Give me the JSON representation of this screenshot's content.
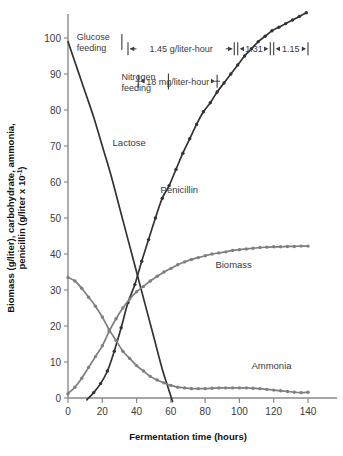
{
  "chart_data": {
    "type": "line",
    "title": "",
    "xlabel": "Fermentation time (hours)",
    "ylabel": "Biomass (g/liter), carbohydrate, ammonia, penicillin (g/liter x 10",
    "ylabel_sup": "-1",
    "ylabel_tail": ")",
    "xlim": [
      0,
      140
    ],
    "ylim": [
      0,
      105
    ],
    "xticks": [
      0,
      20,
      40,
      60,
      80,
      100,
      120,
      140
    ],
    "xtick_labels": [
      "0",
      "20",
      "40",
      "60",
      "80",
      "100",
      "120",
      "140"
    ],
    "yticks": [
      0,
      10,
      20,
      30,
      40,
      50,
      60,
      70,
      80,
      90,
      100
    ],
    "ytick_labels": [
      "0",
      "10",
      "20",
      "30",
      "40",
      "50",
      "60",
      "70",
      "80",
      "90",
      "100"
    ],
    "grid": false,
    "legend": "inline-labels",
    "series": [
      {
        "name": "Lactose",
        "color": "#333333",
        "label_x": 26,
        "label_y": 70,
        "markers": false,
        "x": [
          0,
          5,
          10,
          15,
          20,
          25,
          30,
          35,
          40,
          45,
          50,
          55,
          58,
          61
        ],
        "y": [
          99,
          92,
          85,
          78,
          70,
          62,
          53,
          44,
          35,
          26,
          17,
          8,
          3.5,
          -1
        ]
      },
      {
        "name": "Penicillin",
        "color": "#333333",
        "label_x": 54,
        "label_y": 57,
        "markers": true,
        "x": [
          11,
          15,
          19,
          23,
          27,
          31,
          35,
          39,
          43,
          47,
          51,
          55,
          59,
          63,
          67,
          71,
          75,
          79,
          83,
          87,
          91,
          95,
          99,
          103,
          107,
          111,
          115,
          119,
          123,
          127,
          131,
          135,
          139
        ],
        "y": [
          -0.5,
          1.5,
          4,
          7.5,
          13,
          19.5,
          26.5,
          31.5,
          38,
          44,
          50,
          55.5,
          59,
          63.5,
          68,
          72,
          76,
          79.5,
          82,
          85,
          87.5,
          90,
          92.5,
          95,
          97,
          99,
          100.5,
          102,
          103,
          104,
          105,
          106,
          107
        ]
      },
      {
        "name": "Biomass",
        "color": "#7f7f7f",
        "label_x": 86,
        "label_y": 36,
        "markers": true,
        "x": [
          0,
          4,
          8,
          12,
          16,
          20,
          24,
          28,
          32,
          36,
          40,
          44,
          48,
          52,
          56,
          60,
          64,
          68,
          72,
          76,
          80,
          84,
          88,
          92,
          96,
          100,
          104,
          108,
          112,
          116,
          120,
          124,
          128,
          132,
          136,
          140
        ],
        "y": [
          1.2,
          3.0,
          5.5,
          8.5,
          11.5,
          14.5,
          18.5,
          22.0,
          25.0,
          27.5,
          29.5,
          31.0,
          32.5,
          33.8,
          35.0,
          36.0,
          37.0,
          37.8,
          38.5,
          39.0,
          39.5,
          40.0,
          40.3,
          40.6,
          41.0,
          41.2,
          41.4,
          41.6,
          41.8,
          41.9,
          42.0,
          42.0,
          42.1,
          42.1,
          42.2,
          42.2
        ]
      },
      {
        "name": "Ammonia",
        "color": "#7f7f7f",
        "label_x": 107,
        "label_y": 8,
        "markers": true,
        "x": [
          0,
          4,
          8,
          12,
          16,
          20,
          24,
          28,
          32,
          36,
          40,
          44,
          48,
          52,
          56,
          60,
          64,
          68,
          72,
          76,
          80,
          84,
          88,
          92,
          96,
          100,
          104,
          108,
          112,
          116,
          120,
          124,
          128,
          132,
          136,
          140
        ],
        "y": [
          33.5,
          32.5,
          30.5,
          28.0,
          25.5,
          22.5,
          19.0,
          16.0,
          13.0,
          11.0,
          9.0,
          7.5,
          6.0,
          5.0,
          4.2,
          3.5,
          3.0,
          2.8,
          2.6,
          2.6,
          2.6,
          2.7,
          2.8,
          2.8,
          2.8,
          2.8,
          2.8,
          2.7,
          2.6,
          2.4,
          2.2,
          2.0,
          1.8,
          1.6,
          1.5,
          1.6
        ]
      }
    ],
    "annotations": [
      {
        "id": "glucose-feeding",
        "text_line1": "Glucose",
        "text_line2": "feeding",
        "x": 4,
        "y": 100
      },
      {
        "id": "nitrogen-feeding",
        "text_line1": "Nitrogen",
        "text_line2": "feeding",
        "x": 30,
        "y": 89
      },
      {
        "id": "rate-1",
        "text": "1.45 g/liter-hour",
        "from": 35,
        "to": 97,
        "y": 97
      },
      {
        "id": "rate-2",
        "text": "1.31",
        "from": 99,
        "to": 118,
        "y": 97
      },
      {
        "id": "rate-3",
        "text": "1.15",
        "from": 120,
        "to": 140,
        "y": 97
      },
      {
        "id": "rate-nitrogen",
        "text": "18 mg/liter-hour",
        "from": 41,
        "to": 87,
        "y": 88
      }
    ]
  }
}
